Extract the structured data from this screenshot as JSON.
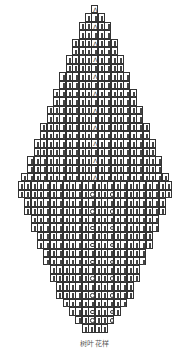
{
  "caption": "树叶花样",
  "cell": {
    "w": 7,
    "h": 8.4
  },
  "center_x": 94.5,
  "symbols": {
    "k": "knit",
    "o": "yarn-over",
    "d": "decrease"
  },
  "rows": [
    {
      "n": 1,
      "cells": "d"
    },
    {
      "n": 3,
      "cells": "kkk"
    },
    {
      "n": 5,
      "cells": "kkdkk"
    },
    {
      "n": 5,
      "cells": "kkkkk"
    },
    {
      "n": 7,
      "cells": "kkkdkkk"
    },
    {
      "n": 7,
      "cells": "kkkkkkk"
    },
    {
      "n": 9,
      "cells": "kkkkdkkkk"
    },
    {
      "n": 9,
      "cells": "kkkkkkkkk"
    },
    {
      "n": 11,
      "cells": "kkkkkdkkkkk"
    },
    {
      "n": 11,
      "cells": "kkkkkkkkkkk"
    },
    {
      "n": 13,
      "cells": "kkkkkkdkkkkkk"
    },
    {
      "n": 13,
      "cells": "kkkkkkkkkkkkk"
    },
    {
      "n": 15,
      "cells": "kkkkkkkdkkkkkkk"
    },
    {
      "n": 15,
      "cells": "kkkkkkkkkkkkkkk"
    },
    {
      "n": 17,
      "cells": "kkkkkkkkdkkkkkkkk"
    },
    {
      "n": 17,
      "cells": "kkkkkkkkkkkkkkkkk"
    },
    {
      "n": 19,
      "cells": "kkkkkkkkkdkkkkkkkkk"
    },
    {
      "n": 19,
      "cells": "kkkkkkkkkkkkkkkkkkk"
    },
    {
      "n": 21,
      "cells": "kkkkkkkkkkdkkkkkkkkkk"
    },
    {
      "n": 21,
      "cells": "kkkkkkkkkkkkkkkkkkkkk"
    },
    {
      "n": 23,
      "cells": "kkkkkkkkkkkdkkkkkkkkkkk"
    },
    {
      "n": 24,
      "cells": "kkkkkkkkkkkkkkkkkkkkkkkk"
    },
    {
      "n": 24,
      "cells": "kkkkkkkkkkkokkokkkkkkkkk"
    },
    {
      "n": 22,
      "cells": "kkkkkkkkkkkkkkkkkkkkkk"
    },
    {
      "n": 22,
      "cells": "kkkkkkkkkkokkokkkkkkkk"
    },
    {
      "n": 20,
      "cells": "kkkkkkkkkkkkkkkkkkkk"
    },
    {
      "n": 20,
      "cells": "kkkkkkkkkokkokkkkkkk"
    },
    {
      "n": 18,
      "cells": "kkkkkkkkkkkkkkkkkk"
    },
    {
      "n": 18,
      "cells": "kkkkkkkkokkokkkkkk"
    },
    {
      "n": 16,
      "cells": "kkkkkkkkkkkkkkkk"
    },
    {
      "n": 16,
      "cells": "kkkkkkkokkokkkkk"
    },
    {
      "n": 14,
      "cells": "kkkkkkkkkkkkkk"
    },
    {
      "n": 14,
      "cells": "kkkkkkokkokkkk"
    },
    {
      "n": 12,
      "cells": "kkkkkkkkkkkk"
    },
    {
      "n": 12,
      "cells": "kkkkkokkokkk"
    },
    {
      "n": 10,
      "cells": "kkkkkkkkkk"
    },
    {
      "n": 8,
      "cells": "kkkokkok"
    },
    {
      "n": 6,
      "cells": "kkokko"
    },
    {
      "n": 4,
      "cells": "kkkk"
    }
  ]
}
